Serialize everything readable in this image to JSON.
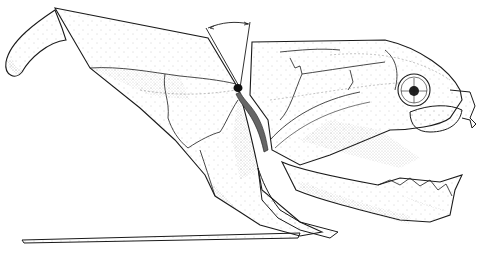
{
  "figure": {
    "style": "stippled line drawing",
    "annotations": {
      "angle_arc": "arc indicating rotation angle at craniothoracic joint"
    },
    "colors": {
      "ink": "#1a1a1a",
      "paper": "#ffffff",
      "stipple": "#555555"
    }
  }
}
